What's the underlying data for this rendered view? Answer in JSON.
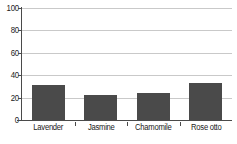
{
  "chart_data": {
    "type": "bar",
    "title": "",
    "subtitle": "",
    "xlabel": "",
    "ylabel": "",
    "categories": [
      "Lavender",
      "Jasmine",
      "Chamomile",
      "Rose otto"
    ],
    "values": [
      31,
      22,
      24,
      33
    ],
    "series": [
      {
        "name": "",
        "values": [
          31,
          22,
          24,
          33
        ]
      }
    ],
    "ylim": [
      0,
      100
    ],
    "yticks": [
      0,
      20,
      40,
      60,
      80,
      100
    ],
    "ytick_labels": [
      "0",
      "20",
      "40",
      "60",
      "80",
      "100"
    ],
    "grid": true,
    "grid_axis": "y",
    "legend": false,
    "legend_position": "none",
    "bar_color": "#4a4a4a",
    "gridline_color": "#c9c9c9",
    "axis_color": "#4a4a4a",
    "background_color": "#ffffff",
    "text_color": "#1a1a1a",
    "annotations": []
  }
}
